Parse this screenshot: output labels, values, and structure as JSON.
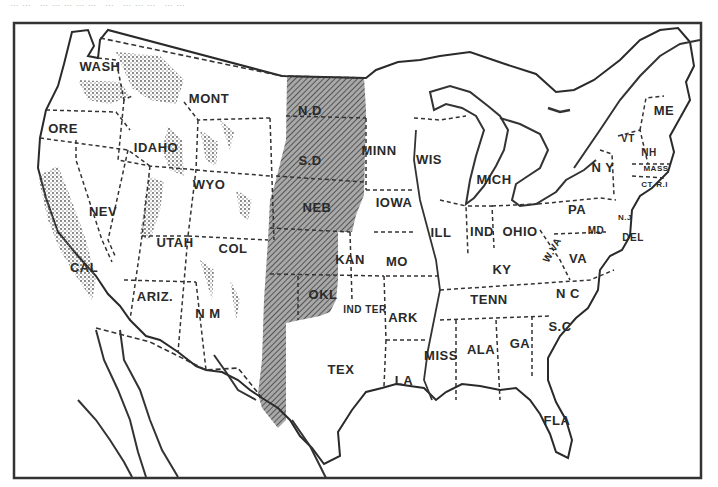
{
  "caption": "…… …………… … ……… ……",
  "map": {
    "title": "Map of the United States showing the Great Plains region (shaded)",
    "shaded_region": {
      "label": "Great Plains",
      "states": [
        "N.D",
        "S.D",
        "NEB",
        "KAN",
        "OKL",
        "TEX (west)",
        "COL (east)",
        "N.M (east)",
        "WYO (east)",
        "MONT (east)"
      ],
      "fill_color": "#8a8a8a"
    },
    "colors": {
      "ink": "#2a2a2a",
      "paper": "#ffffff",
      "plains": "#8c8c8c",
      "mountains": "#9a9a9a"
    },
    "states": [
      {
        "id": "wash",
        "label": "WASH",
        "x": 100,
        "y": 66
      },
      {
        "id": "ore",
        "label": "ORE",
        "x": 63,
        "y": 128
      },
      {
        "id": "idaho",
        "label": "IDAHO",
        "x": 156,
        "y": 147
      },
      {
        "id": "mont",
        "label": "MONT",
        "x": 209,
        "y": 98
      },
      {
        "id": "wyo",
        "label": "WYO",
        "x": 209,
        "y": 184
      },
      {
        "id": "nev",
        "label": "NEV",
        "x": 103,
        "y": 211
      },
      {
        "id": "utah",
        "label": "UTAH",
        "x": 175,
        "y": 242
      },
      {
        "id": "col",
        "label": "COL",
        "x": 233,
        "y": 248
      },
      {
        "id": "cal",
        "label": "CAL",
        "x": 84,
        "y": 267
      },
      {
        "id": "ariz",
        "label": "ARIZ.",
        "x": 155,
        "y": 296
      },
      {
        "id": "nm",
        "label": "N M",
        "x": 208,
        "y": 313
      },
      {
        "id": "nd",
        "label": "N.D",
        "x": 310,
        "y": 110
      },
      {
        "id": "sd",
        "label": "S.D",
        "x": 310,
        "y": 160
      },
      {
        "id": "neb",
        "label": "NEB",
        "x": 317,
        "y": 207
      },
      {
        "id": "kan",
        "label": "KAN",
        "x": 350,
        "y": 259
      },
      {
        "id": "okl",
        "label": "OKL",
        "x": 323,
        "y": 294
      },
      {
        "id": "ind_ter",
        "label": "IND TER",
        "x": 365,
        "y": 309
      },
      {
        "id": "tex",
        "label": "TEX",
        "x": 341,
        "y": 369
      },
      {
        "id": "minn",
        "label": "MINN",
        "x": 379,
        "y": 150
      },
      {
        "id": "iowa",
        "label": "IOWA",
        "x": 394,
        "y": 202
      },
      {
        "id": "mo",
        "label": "MO",
        "x": 397,
        "y": 261
      },
      {
        "id": "ark",
        "label": "ARK",
        "x": 403,
        "y": 317
      },
      {
        "id": "la",
        "label": "LA",
        "x": 404,
        "y": 380
      },
      {
        "id": "wis",
        "label": "WIS",
        "x": 429,
        "y": 159
      },
      {
        "id": "ill",
        "label": "ILL",
        "x": 441,
        "y": 232
      },
      {
        "id": "mich",
        "label": "MICH",
        "x": 494,
        "y": 179
      },
      {
        "id": "ind",
        "label": "IND",
        "x": 482,
        "y": 231
      },
      {
        "id": "ohio",
        "label": "OHIO",
        "x": 520,
        "y": 231
      },
      {
        "id": "ky",
        "label": "KY",
        "x": 502,
        "y": 269
      },
      {
        "id": "tenn",
        "label": "TENN",
        "x": 489,
        "y": 299
      },
      {
        "id": "miss",
        "label": "MISS",
        "x": 441,
        "y": 355
      },
      {
        "id": "ala",
        "label": "ALA",
        "x": 481,
        "y": 349
      },
      {
        "id": "ga",
        "label": "GA",
        "x": 520,
        "y": 343
      },
      {
        "id": "fla",
        "label": "FLA",
        "x": 557,
        "y": 420
      },
      {
        "id": "sc",
        "label": "S.C",
        "x": 560,
        "y": 326
      },
      {
        "id": "nc",
        "label": "N C",
        "x": 568,
        "y": 293
      },
      {
        "id": "va",
        "label": "VA",
        "x": 578,
        "y": 258
      },
      {
        "id": "wva",
        "label": "W.VA",
        "x": 552,
        "y": 250
      },
      {
        "id": "md",
        "label": "MD",
        "x": 596,
        "y": 230
      },
      {
        "id": "del",
        "label": "DEL",
        "x": 633,
        "y": 237
      },
      {
        "id": "nj",
        "label": "N.J",
        "x": 625,
        "y": 217
      },
      {
        "id": "pa",
        "label": "PA",
        "x": 577,
        "y": 209
      },
      {
        "id": "ny",
        "label": "N Y",
        "x": 603,
        "y": 167
      },
      {
        "id": "vt",
        "label": "VT",
        "x": 628,
        "y": 138
      },
      {
        "id": "nh",
        "label": "NH",
        "x": 649,
        "y": 152
      },
      {
        "id": "mass",
        "label": "MASS",
        "x": 656,
        "y": 168
      },
      {
        "id": "ct",
        "label": "CT",
        "x": 647,
        "y": 184
      },
      {
        "id": "ri",
        "label": "R.I",
        "x": 662,
        "y": 184
      },
      {
        "id": "me",
        "label": "ME",
        "x": 664,
        "y": 110
      }
    ]
  }
}
